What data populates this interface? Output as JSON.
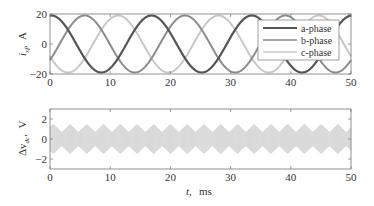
{
  "chart_data": [
    {
      "type": "line",
      "title": "",
      "xlabel": "",
      "ylabel": "i_xf, A",
      "ylabel_parts": {
        "symbol": "i",
        "subscript": "xf",
        "unit": "A"
      },
      "xlim": [
        0,
        50
      ],
      "ylim": [
        -20,
        20
      ],
      "xticks": [
        0,
        10,
        20,
        30,
        40,
        50
      ],
      "yticks": [
        -20,
        0,
        20
      ],
      "grid": false,
      "legend_position": "upper right",
      "frequency_hz": 60,
      "series": [
        {
          "name": "a-phase",
          "color": "#555555",
          "width": 2.2,
          "amplitude": 19,
          "peak_time_ms": 0.2
        },
        {
          "name": "b-phase",
          "color": "#8c8c8c",
          "width": 2.0,
          "amplitude": 19,
          "peak_time_ms": 5.76
        },
        {
          "name": "c-phase",
          "color": "#c8c8c8",
          "width": 2.0,
          "amplitude": 19,
          "peak_time_ms": 11.31
        }
      ],
      "description": "Three-phase sinusoidal currents, ~19 A amplitude, 60 Hz (period ~16.7 ms), 120 degree phase shifts"
    },
    {
      "type": "area",
      "title": "",
      "xlabel": "t, ms",
      "xlabel_parts": {
        "symbol": "t",
        "unit": "ms"
      },
      "ylabel": "Δv_dc, V",
      "ylabel_parts": {
        "symbol": "Δv",
        "subscript": "dc",
        "unit": "V"
      },
      "xlim": [
        0,
        50
      ],
      "ylim": [
        -3,
        3
      ],
      "xticks": [
        0,
        10,
        20,
        30,
        40,
        50
      ],
      "yticks": [
        -2,
        0,
        2
      ],
      "grid": false,
      "series": [
        {
          "name": "dc-link voltage ripple",
          "color": "#d6d6d6",
          "envelope_max_v": 1.5,
          "envelope_min_v": 0.7,
          "envelope_period_ms": 2.78
        }
      ],
      "description": "High-frequency switching ripple band centred on 0 V with diamond-shaped envelope repeating at 6x line frequency (~360 Hz), peak about ±1.5 V"
    }
  ],
  "labels": {
    "top_ylabel_symbol": "i",
    "top_ylabel_sub": "xf",
    "top_ylabel_unit": "A",
    "bottom_ylabel_symbol": "Δv",
    "bottom_ylabel_sub": "dc",
    "bottom_ylabel_unit": "V",
    "xlabel_symbol": "t,",
    "xlabel_unit": "ms",
    "legend": [
      "a-phase",
      "b-phase",
      "c-phase"
    ],
    "top_yticks": [
      "20",
      "0",
      "−20"
    ],
    "bottom_yticks": [
      "2",
      "0",
      "−2"
    ],
    "xticks": [
      "0",
      "10",
      "20",
      "30",
      "40",
      "50"
    ]
  }
}
